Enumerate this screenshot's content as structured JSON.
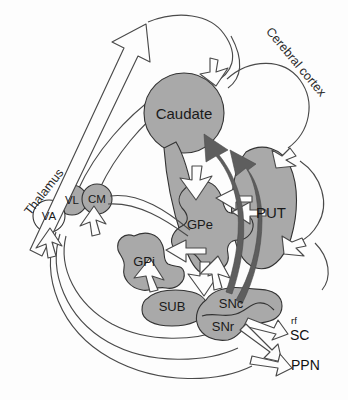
{
  "figure": {
    "colors": {
      "nucleus_gray": "#a9a9a9",
      "nucleus_stroke": "#333333",
      "background": "#fdfdfd",
      "hollow_arrow_fill": "#fdfdfd",
      "hollow_arrow_stroke": "#4a4a4a",
      "dark_arrow_fill": "#5e5e5e",
      "text": "#1a1a1a"
    }
  },
  "regions": [
    {
      "id": "thalamus",
      "label": "Thalamus",
      "rotation": -52,
      "x": 44,
      "y": 192
    },
    {
      "id": "cerebral-cortex",
      "label": "Cerebral cortex",
      "rotation": 50,
      "x": 296,
      "y": 62
    }
  ],
  "nuclei": [
    {
      "id": "caudate",
      "label": "Caudate",
      "shape": "circle",
      "x": 184,
      "y": 113,
      "fill": "#a9a9a9",
      "size": "lbl-lg"
    },
    {
      "id": "put",
      "label": "PUT",
      "shape": "blob",
      "x": 271,
      "y": 212,
      "fill": "#a9a9a9",
      "size": "lbl-lg"
    },
    {
      "id": "gpe",
      "label": "GPe",
      "shape": "blob",
      "x": 200,
      "y": 224,
      "fill": "#a9a9a9",
      "size": "lbl-md"
    },
    {
      "id": "gpi",
      "label": "GPi",
      "shape": "blob",
      "x": 144,
      "y": 261,
      "fill": "#a9a9a9",
      "size": "lbl-md"
    },
    {
      "id": "sub",
      "label": "SUB",
      "shape": "blob",
      "x": 172,
      "y": 306,
      "fill": "#a9a9a9",
      "size": "lbl-md"
    },
    {
      "id": "snc",
      "label": "SNc",
      "shape": "blob",
      "x": 231,
      "y": 303,
      "fill": "#a9a9a9",
      "size": "lbl-md"
    },
    {
      "id": "snr",
      "label": "SNr",
      "shape": "blob",
      "x": 223,
      "y": 326,
      "fill": "#a9a9a9",
      "size": "lbl-md"
    },
    {
      "id": "va",
      "label": "VA",
      "shape": "circle",
      "x": 49,
      "y": 216,
      "fill": "#fdfdfd",
      "size": "lbl-sm"
    },
    {
      "id": "vl",
      "label": "VL",
      "shape": "circle",
      "x": 72,
      "y": 200,
      "fill": "#a9a9a9",
      "size": "lbl-sm"
    },
    {
      "id": "cm",
      "label": "CM",
      "shape": "circle",
      "x": 97,
      "y": 199,
      "fill": "#a9a9a9",
      "size": "lbl-sm"
    }
  ],
  "outputs": [
    {
      "id": "rf",
      "label": "rf",
      "x": 291,
      "y": 320,
      "size": "small"
    },
    {
      "id": "sc",
      "label": "SC",
      "x": 290,
      "y": 335,
      "size": "normal"
    },
    {
      "id": "ppn",
      "label": "PPN",
      "x": 291,
      "y": 365,
      "size": "normal"
    }
  ]
}
